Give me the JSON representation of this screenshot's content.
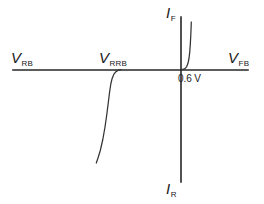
{
  "figure": {
    "type": "diode-iv-characteristic",
    "background_color": "#ffffff",
    "line_color": "#333333",
    "axis_color": "#262626"
  },
  "axes": {
    "horizontal": {
      "name": "voltage-axis",
      "x_start": 13,
      "x_end": 248,
      "y": 70
    },
    "vertical": {
      "name": "current-axis",
      "x": 181,
      "y_start": 17,
      "y_end": 182
    },
    "origin": {
      "x": 181,
      "y": 70
    }
  },
  "labels": {
    "reverse_bias": {
      "symbol": "V",
      "subscript": "RB"
    },
    "reverse_breakdown": {
      "symbol": "V",
      "subscript": "RRB"
    },
    "forward_bias": {
      "symbol": "V",
      "subscript": "FB"
    },
    "forward_current": {
      "symbol": "I",
      "subscript": "F"
    },
    "reverse_current": {
      "symbol": "I",
      "subscript": "R"
    },
    "knee_voltage": "0.6 V"
  },
  "chart_data": {
    "type": "line",
    "title": "",
    "xlabel": "",
    "ylabel": "",
    "grid": false,
    "legend": null,
    "axis_annotations": {
      "x_negative_end": "V RB",
      "x_breakdown": "V RRB",
      "x_positive_end": "V FB",
      "y_positive_end": "I F",
      "y_negative_end": "I R",
      "knee_voltage_label": "0.6 V"
    },
    "series": [
      {
        "name": "forward-conduction",
        "description": "Forward bias knee rising steeply above 0.6 V",
        "path": "M 181.5 69.5 L 183.6 69.2 L 185.3 68.3 L 186.7 66.6 L 187.9 63.6 L 188.9 59.0 L 189.7 52.6 L 190.3 44.4 L 190.8 35.0 L 191.1 27.5 L 191.3 22.0"
      },
      {
        "name": "reverse-breakdown",
        "description": "Reverse breakdown knee dropping steeply at V RRB",
        "path": "M 121.0 69.5 L 118.4 70.2 L 116.0 71.6 L 113.9 74.2 L 112.2 78.2 L 110.8 84.0 L 109.6 92.0 L 108.3 102.5 L 106.8 114.5 L 105.0 127.0 L 102.8 139.5 L 100.3 150.5 L 98.0 158.0 L 96.3 163.0"
      }
    ]
  }
}
